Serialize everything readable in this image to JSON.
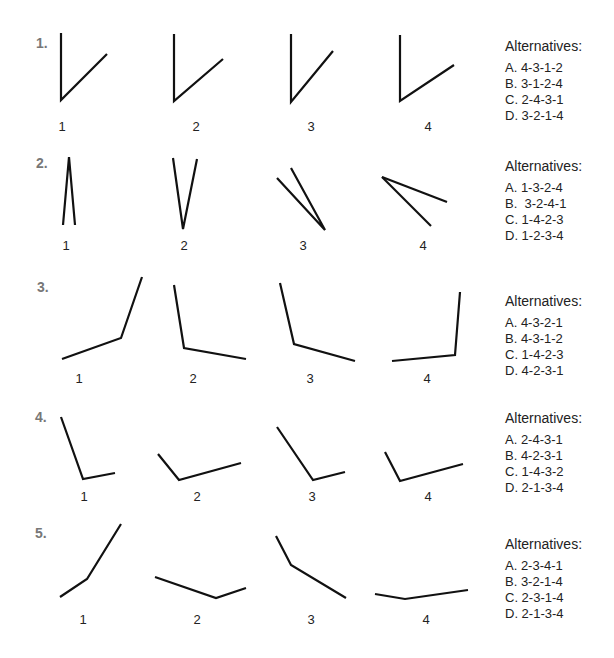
{
  "questions": [
    {
      "number": "1.",
      "figure_labels": [
        "1",
        "2",
        "3",
        "4"
      ],
      "alternatives_title": "Alternatives:",
      "options": [
        "A. 4-3-1-2",
        "B. 3-1-2-4",
        "C. 2-4-3-1",
        "D. 3-2-1-4"
      ]
    },
    {
      "number": "2.",
      "figure_labels": [
        "1",
        "2",
        "3",
        "4"
      ],
      "alternatives_title": "Alternatives:",
      "options": [
        "A. 1-3-2-4",
        "B.  3-2-4-1",
        "C. 1-4-2-3",
        "D. 1-2-3-4"
      ]
    },
    {
      "number": "3.",
      "figure_labels": [
        "1",
        "2",
        "3",
        "4"
      ],
      "alternatives_title": "Alternatives:",
      "options": [
        "A. 4-3-2-1",
        "B. 4-3-1-2",
        "C. 1-4-2-3",
        "D. 4-2-3-1"
      ]
    },
    {
      "number": "4.",
      "figure_labels": [
        "1",
        "2",
        "3",
        "4"
      ],
      "alternatives_title": "Alternatives:",
      "options": [
        "A. 2-4-3-1",
        "B. 4-2-3-1",
        "C. 1-4-3-2",
        "D. 2-1-3-4"
      ]
    },
    {
      "number": "5.",
      "figure_labels": [
        "1",
        "2",
        "3",
        "4"
      ],
      "alternatives_title": "Alternatives:",
      "options": [
        "A. 2-3-4-1",
        "B. 3-2-1-4",
        "C. 2-3-1-4",
        "D. 2-1-3-4"
      ]
    }
  ],
  "colors": {
    "line": "#111111",
    "question_number": "#777777",
    "text": "#222222",
    "background": "#ffffff"
  }
}
